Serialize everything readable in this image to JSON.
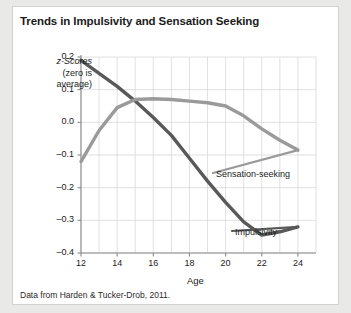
{
  "figure": {
    "title": "Trends in Impulsivity and Sensation Seeking",
    "source_note": "Data from Harden & Tucker-Drob, 2011.",
    "background_color": "#e9e9e7",
    "card_color": "#ffffff"
  },
  "axes": {
    "y_label_line1": "z-Scores",
    "y_label_line2": "(zero is",
    "y_label_line3": "average)",
    "x_title": "Age",
    "y_ticks": [
      "0.2",
      "0.1",
      "0.0",
      "–0.1",
      "–0.2",
      "–0.3",
      "–0.4"
    ],
    "x_ticks": [
      "12",
      "14",
      "16",
      "18",
      "20",
      "22",
      "24"
    ]
  },
  "series_labels": {
    "sensation": "Sensation-seeking",
    "impulsivity": "Impulsivity"
  },
  "chart_data": {
    "type": "line",
    "title": "Trends in Impulsivity and Sensation Seeking",
    "xlabel": "Age",
    "ylabel": "z-Scores (zero is average)",
    "xlim": [
      12,
      25
    ],
    "ylim": [
      -0.4,
      0.2
    ],
    "grid": true,
    "legend": "inline-annotations",
    "annotation": "Data from Harden & Tucker-Drob, 2011.",
    "x": [
      12,
      13,
      14,
      15,
      16,
      17,
      18,
      19,
      20,
      21,
      22,
      23,
      24
    ],
    "series": [
      {
        "name": "Impulsivity",
        "color": "#595959",
        "values": [
          0.19,
          0.15,
          0.11,
          0.065,
          0.015,
          -0.04,
          -0.11,
          -0.18,
          -0.245,
          -0.305,
          -0.345,
          -0.335,
          -0.32
        ]
      },
      {
        "name": "Sensation-seeking",
        "color": "#9a9a9a",
        "values": [
          -0.12,
          -0.025,
          0.045,
          0.07,
          0.072,
          0.07,
          0.065,
          0.06,
          0.05,
          0.02,
          -0.02,
          -0.055,
          -0.085
        ]
      }
    ]
  }
}
